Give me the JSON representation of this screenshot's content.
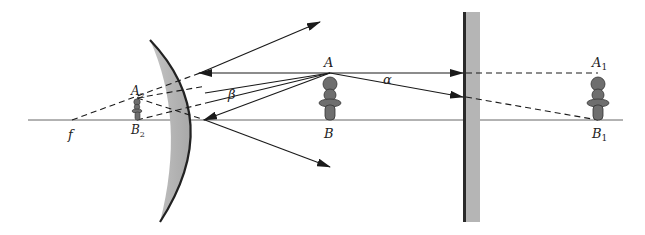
{
  "diagram": {
    "type": "optics-ray-diagram",
    "colors": {
      "background": "#ffffff",
      "line": "#1a1a1a",
      "axis": "#555555",
      "mirror_fill": "#b8b8b8",
      "mirror_edge": "#222222",
      "figure_fill": "#6e6e6e"
    },
    "labels": {
      "object_top": "A",
      "object_bottom": "B",
      "plane_image_top": "A",
      "plane_image_top_sub": "1",
      "plane_image_bottom": "B",
      "plane_image_bottom_sub": "1",
      "convex_image_top": "A",
      "convex_image_top_sub": "2",
      "convex_image_bottom": "B",
      "convex_image_bottom_sub": "2",
      "focus": "f",
      "angle_plane": "α",
      "angle_convex": "β"
    },
    "elements": {
      "optical_axis": {
        "x1": 28,
        "x2": 623,
        "y": 120
      },
      "convex_mirror": {
        "top": [
          150,
          40
        ],
        "vertex": [
          205,
          120
        ],
        "bottom": [
          160,
          222
        ]
      },
      "plane_mirror": {
        "x": 463,
        "width": 17,
        "y_top": 12,
        "y_bottom": 222
      },
      "object": {
        "x": 330,
        "top_y": 73,
        "bottom_y": 120
      },
      "plane_image": {
        "x": 598,
        "top_y": 73,
        "bottom_y": 120
      },
      "convex_image": {
        "x": 137,
        "top_y": 98,
        "bottom_y": 120
      },
      "focus_point": {
        "x": 72,
        "y": 120
      }
    }
  }
}
